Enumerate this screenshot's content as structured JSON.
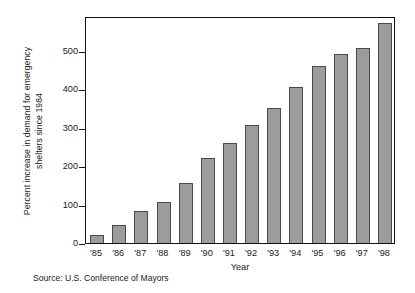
{
  "chart_data": {
    "type": "bar",
    "title": "",
    "subtitle": "",
    "xlabel": "Year",
    "ylabel": "Percent increase in demand for emergency shelters since 1984",
    "ylabel_line1": "Percent increase in demand for emergency",
    "ylabel_line2": "shelters since 1984",
    "categories": [
      "'85",
      "'86",
      "'87",
      "'88",
      "'89",
      "'90",
      "'91",
      "'92",
      "'93",
      "'94",
      "'95",
      "'96",
      "'97",
      "'98"
    ],
    "values": [
      21,
      47,
      83,
      107,
      157,
      221,
      260,
      308,
      352,
      406,
      461,
      490,
      507,
      573
    ],
    "series": [
      {
        "name": "Percent increase in demand for emergency shelters since 1984",
        "values": [
          21,
          47,
          83,
          107,
          157,
          221,
          260,
          308,
          352,
          406,
          461,
          490,
          507,
          573
        ]
      }
    ],
    "ylim": [
      0,
      590
    ],
    "yticks": [
      0,
      100,
      200,
      300,
      400,
      500
    ],
    "ytick_labels": [
      "0",
      "100",
      "200",
      "300",
      "400",
      "500"
    ],
    "grid": false,
    "legend": false,
    "legend_position": "none",
    "bar_color": "#9c9c9c",
    "bar_edge_color": "#4a4a4a",
    "frame_color": "#111111",
    "background_color": "#ffffff"
  },
  "source": {
    "text": "Source: U.S. Conference of Mayors"
  }
}
